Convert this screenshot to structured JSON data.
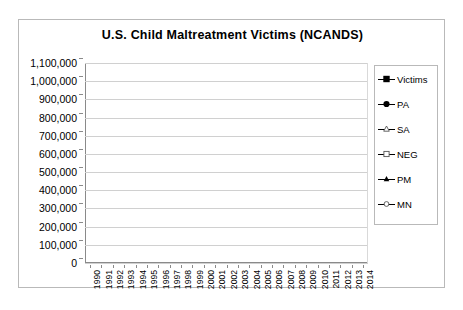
{
  "chart_data": {
    "type": "line",
    "title": "U.S. Child Maltreatment Victims (NCANDS)",
    "xlabel": "",
    "ylabel": "",
    "ylim": [
      0,
      1100000
    ],
    "ytick_step": 100000,
    "grid": true,
    "legend_position": "right",
    "categories": [
      "1990",
      "1991",
      "1992",
      "1993",
      "1994",
      "1995",
      "1996",
      "1997",
      "1998",
      "1999",
      "2000",
      "2001",
      "2002",
      "2003",
      "2004",
      "2005",
      "2006",
      "2007",
      "2008",
      "2009",
      "2010",
      "2011",
      "2012",
      "2013",
      "2014"
    ],
    "ytick_labels": [
      "1,100,000",
      "1,000,000",
      "900,000",
      "800,000",
      "700,000",
      "600,000",
      "500,000",
      "400,000",
      "300,000",
      "200,000",
      "100,000",
      "0"
    ],
    "series": [
      {
        "name": "Victims",
        "marker": "filled-square",
        "values": [
          861000,
          904000,
          993000,
          1018000,
          1012000,
          996000,
          969000,
          956000,
          904000,
          826000,
          879000,
          903000,
          896000,
          906000,
          885000,
          899000,
          905000,
          794000,
          759000,
          742000,
          695000,
          681000,
          686000,
          679000,
          702000
        ]
      },
      {
        "name": "PA",
        "marker": "filled-circle",
        "values": [
          216000,
          225000,
          228000,
          229000,
          232000,
          229000,
          245000,
          212000,
          172000,
          160000,
          167000,
          170000,
          166000,
          165000,
          152000,
          150000,
          145000,
          112000,
          124000,
          127000,
          132000,
          129000,
          131000,
          131000,
          126000
        ]
      },
      {
        "name": "SA",
        "marker": "open-triangle",
        "values": [
          null,
          null,
          null,
          null,
          null,
          30000,
          30000,
          29000,
          25000,
          4000,
          24000,
          24000,
          24000,
          24000,
          23000,
          23000,
          22000,
          12000,
          24000,
          24000,
          23000,
          22000,
          22000,
          21000,
          20000
        ]
      },
      {
        "name": "NEG",
        "marker": "open-square",
        "values": [
          412000,
          423000,
          500000,
          474000,
          492000,
          492000,
          492000,
          495000,
          454000,
          450000,
          540000,
          533000,
          537000,
          548000,
          551000,
          549000,
          584000,
          483000,
          553000,
          600000,
          550000,
          542000,
          545000,
          546000,
          540000
        ]
      },
      {
        "name": "PM",
        "marker": "filled-triangle",
        "values": [
          null,
          null,
          null,
          null,
          null,
          46000,
          46000,
          44000,
          38000,
          8000,
          56000,
          56000,
          53000,
          53000,
          52000,
          53000,
          53000,
          33000,
          57000,
          57000,
          55000,
          53000,
          52000,
          51000,
          48000
        ]
      },
      {
        "name": "MN",
        "marker": "open-circle",
        "values": [
          152000,
          148000,
          146000,
          143000,
          140000,
          136000,
          132000,
          128000,
          124000,
          120000,
          92000,
          90000,
          88000,
          86000,
          84000,
          82000,
          80000,
          43000,
          78000,
          77000,
          76000,
          74000,
          72000,
          70000,
          68000
        ]
      }
    ]
  },
  "legend": {
    "items": [
      {
        "label": "Victims",
        "marker": "filled-square"
      },
      {
        "label": "PA",
        "marker": "filled-circle"
      },
      {
        "label": "SA",
        "marker": "open-triangle"
      },
      {
        "label": "NEG",
        "marker": "open-square"
      },
      {
        "label": "PM",
        "marker": "filled-triangle"
      },
      {
        "label": "MN",
        "marker": "open-circle"
      }
    ]
  },
  "colors": {
    "line": "#000000",
    "grid": "#d0d0d0",
    "axis": "#8a8a8a",
    "frame": "#b9b9b9",
    "background": "#ffffff"
  }
}
